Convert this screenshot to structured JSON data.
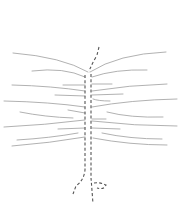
{
  "diagram": {
    "colors": {
      "background": "#ffffff",
      "strands": "#a8a8a8",
      "stem": "#555555"
    },
    "stem": {
      "left_path": "M85,75 L85,170 Q84,180 76,186 L73,194",
      "right_path": "M91,74 L91,178 Q92,190 93,204",
      "top_path": "M99,47 L97,55 Q92,64 89,71",
      "hook_path": "M94,183 Q100,182 106,185 Q104,190 97,188"
    },
    "strands": [
      {
        "side": "left",
        "d": "M13,53 Q62,57 88,72"
      },
      {
        "side": "right",
        "d": "M90,72 Q118,54 166,52"
      },
      {
        "side": "left",
        "d": "M32,71 Q64,67 85,77"
      },
      {
        "side": "right",
        "d": "M92,77 Q115,69 147,70"
      },
      {
        "side": "left",
        "d": "M12,85 Q52,86 85,91"
      },
      {
        "side": "left",
        "d": "M63,85 L85,85"
      },
      {
        "side": "right",
        "d": "M92,84 L112,84"
      },
      {
        "side": "right",
        "d": "M92,91 Q130,85 167,84"
      },
      {
        "side": "left",
        "d": "M55,95 L85,96"
      },
      {
        "side": "right",
        "d": "M92,95 L123,94"
      },
      {
        "side": "left",
        "d": "M4,101 Q50,102 85,107"
      },
      {
        "side": "right",
        "d": "M93,99 Q98,101 110,101"
      },
      {
        "side": "right",
        "d": "M92,107 Q130,100 177,99"
      },
      {
        "side": "left",
        "d": "M20,112 Q45,117 73,118"
      },
      {
        "side": "left",
        "d": "M68,110 L85,113"
      },
      {
        "side": "right",
        "d": "M107,112 Q130,118 163,117"
      },
      {
        "side": "right",
        "d": "M92,119 L106,119"
      },
      {
        "side": "left",
        "d": "M4,127 Q45,125 85,120"
      },
      {
        "side": "right",
        "d": "M92,121 Q135,126 177,126"
      },
      {
        "side": "left",
        "d": "M58,129 L85,128"
      },
      {
        "side": "right",
        "d": "M92,128 L120,129"
      },
      {
        "side": "left",
        "d": "M17,140 Q50,138 78,133"
      },
      {
        "side": "right",
        "d": "M102,133 Q130,139 162,139"
      },
      {
        "side": "left",
        "d": "M12,146 Q50,143 85,137"
      },
      {
        "side": "right",
        "d": "M93,138 Q130,145 167,145"
      }
    ]
  }
}
